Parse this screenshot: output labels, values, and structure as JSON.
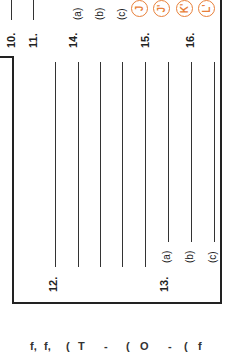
{
  "sheet": {
    "orientation": "rotated -90deg",
    "questions": {
      "q10": "10.",
      "q11": "11.",
      "q12": "12.",
      "q13": "13.",
      "q13_parts": [
        "(a)",
        "(b)",
        "(c)"
      ],
      "q14": "14.",
      "q14_parts": [
        "(a)",
        "(b)",
        "(c)"
      ],
      "q15": "15.",
      "q16": "16."
    },
    "circled_answers": [
      "J",
      "J'",
      "K'",
      "L'"
    ],
    "accent_color": "#e8803a",
    "footer_fragments": [
      "f,",
      "f,",
      "(",
      "T",
      "-",
      "(",
      "O",
      "-",
      "(",
      "f"
    ]
  }
}
